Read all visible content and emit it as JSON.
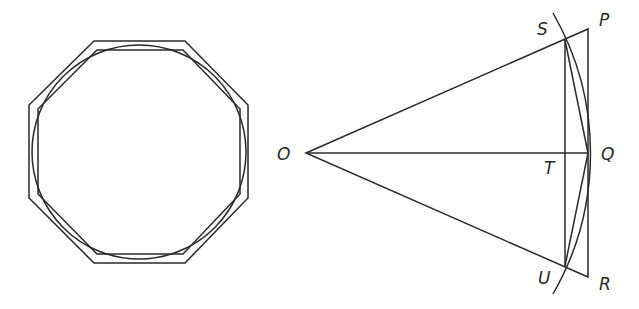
{
  "left_figure": {
    "name": "inscribed-and-circumscribed-octagons",
    "circle": {
      "cx": 139,
      "cy": 152,
      "r": 107
    },
    "outer_octagon": "94,41 185,41 248,105 248,198 185,263 94,263 29,198 29,105",
    "inner_octagon": "97,50 183,50 240,109 240,194 183,254 97,254 38,194 38,109"
  },
  "right_figure": {
    "points": {
      "O": {
        "x": 306,
        "y": 153
      },
      "P": {
        "x": 588,
        "y": 29
      },
      "Q": {
        "x": 588,
        "y": 153
      },
      "R": {
        "x": 588,
        "y": 277
      },
      "S": {
        "x": 565,
        "y": 40
      },
      "T": {
        "x": 565,
        "y": 153
      },
      "U": {
        "x": 565,
        "y": 266
      }
    },
    "labels": {
      "O": "O",
      "P": "P",
      "Q": "Q",
      "R": "R",
      "S": "S",
      "T": "T",
      "U": "U"
    },
    "arc": {
      "start": "553,13",
      "end": "553,294",
      "radius": 282
    }
  }
}
